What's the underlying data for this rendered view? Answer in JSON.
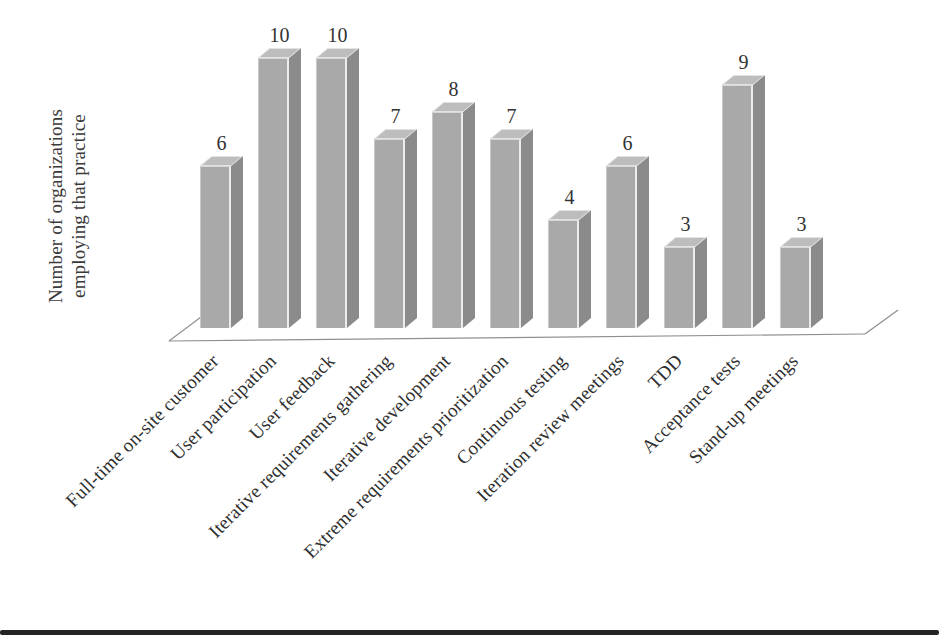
{
  "chart_data": {
    "type": "bar",
    "style": "3d-column",
    "title": "",
    "ylabel": "Number of organizations employing that practice",
    "ylabel_lines": [
      "Number of organizations",
      "employing that practice"
    ],
    "xlabel": "",
    "categories": [
      "Full-time on-site customer",
      "User participation",
      "User feedback",
      "Iterative requirements gathering",
      "Iterative development",
      "Extreme requirements prioritization",
      "Continuous testing",
      "Iteration review meetings",
      "TDD",
      "Acceptance tests",
      "Stand-up meetings"
    ],
    "values": [
      6,
      10,
      10,
      7,
      8,
      7,
      4,
      6,
      3,
      9,
      3
    ],
    "ylim": [
      0,
      10
    ],
    "grid": false,
    "legend": null,
    "value_labels_shown": true,
    "category_label_rotation_deg": 45,
    "colors": {
      "bar_front": "#a9a9a9",
      "bar_side": "#8b8b8b",
      "bar_top": "#bdbdbd",
      "bar_edge_highlight": "#ececec",
      "baseline": "#8f8f8f",
      "text": "#2e2e2e",
      "page_rule": "#242424"
    }
  }
}
